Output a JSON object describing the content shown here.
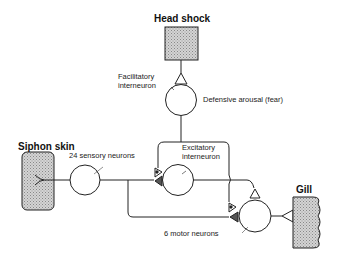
{
  "diagram": {
    "nodes": {
      "head_shock": {
        "label": "Head shock"
      },
      "facilitatory": {
        "label_line1": "Facilitatory",
        "label_line2": "interneuron",
        "note": "Defensive arousal (fear)"
      },
      "siphon_skin": {
        "label": "Siphon skin"
      },
      "sensory": {
        "label": "24 sensory neurons"
      },
      "excitatory": {
        "label_line1": "Excitatory",
        "label_line2": "interneuron"
      },
      "motor": {
        "label": "6 motor neurons"
      },
      "gill": {
        "label": "Gill"
      }
    },
    "colors": {
      "stroke": "#222222",
      "fill_stipple": "#c8c8c8",
      "synapse_dark": "#555555"
    }
  }
}
